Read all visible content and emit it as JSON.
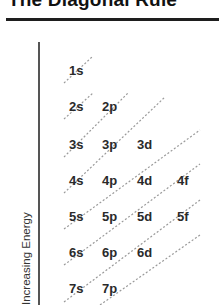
{
  "title": "The Diagonal Rule",
  "axis": {
    "label": "Increasing Energy"
  },
  "orbitals": {
    "row1": [
      "1s"
    ],
    "row2": [
      "2s",
      "2p"
    ],
    "row3": [
      "3s",
      "3p",
      "3d"
    ],
    "row4": [
      "4s",
      "4p",
      "4d",
      "4f"
    ],
    "row5": [
      "5s",
      "5p",
      "5d",
      "5f"
    ],
    "row6": [
      "6s",
      "6p",
      "6d"
    ],
    "row7": [
      "7s",
      "7p"
    ]
  },
  "colors": {
    "text": "#2a2a2a",
    "rule": "#1e1e1e",
    "axis": "#555555",
    "diagonal": "#9a9a9a"
  }
}
